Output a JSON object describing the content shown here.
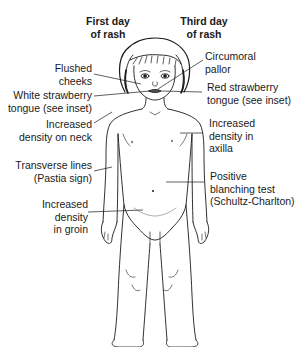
{
  "headers": {
    "first_day": [
      "First day",
      "of rash"
    ],
    "third_day": [
      "Third day",
      "of rash"
    ]
  },
  "labels_left": [
    {
      "id": "flushed-cheeks",
      "lines": [
        "Flushed",
        "cheeks"
      ]
    },
    {
      "id": "white-strawberry-tongue",
      "lines": [
        "White strawberry",
        "tongue (see inset)"
      ]
    },
    {
      "id": "increased-density-neck",
      "lines": [
        "Increased",
        "density on neck"
      ]
    },
    {
      "id": "transverse-lines",
      "lines": [
        "Transverse lines",
        "(Pastia sign)"
      ]
    },
    {
      "id": "increased-density-groin",
      "lines": [
        "Increased",
        "density",
        "in groin"
      ]
    }
  ],
  "labels_right": [
    {
      "id": "circumoral-pallor",
      "lines": [
        "Circumoral",
        "pallor"
      ]
    },
    {
      "id": "red-strawberry-tongue",
      "lines": [
        "Red strawberry",
        "tongue (see inset)"
      ]
    },
    {
      "id": "increased-density-axilla",
      "lines": [
        "Increased",
        "density in",
        "axilla"
      ]
    },
    {
      "id": "positive-blanching-test",
      "lines": [
        "Positive",
        "blanching test",
        "(Schultz-Charlton)"
      ]
    }
  ],
  "colors": {
    "ink": "#1a1a1a",
    "background": "#ffffff",
    "shading": "#8a8a8a"
  }
}
